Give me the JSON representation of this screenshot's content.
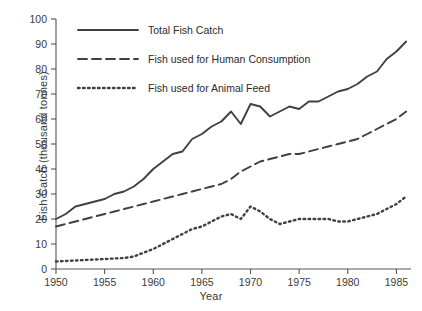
{
  "chart_data": {
    "type": "line",
    "title": "",
    "xlabel": "Year",
    "ylabel": "Fish Catch (thousand tonnes)",
    "xlim": [
      1950,
      1986.5
    ],
    "ylim": [
      0,
      100
    ],
    "xticks": [
      1950,
      1955,
      1960,
      1965,
      1970,
      1975,
      1980,
      1985
    ],
    "xticklabels": [
      "1950",
      "1955",
      "1960",
      "1965",
      "1970",
      "1975",
      "1980",
      "1985"
    ],
    "yticks": [
      0,
      10,
      20,
      30,
      40,
      50,
      60,
      70,
      80,
      90,
      100
    ],
    "yticklabels": [
      "0",
      "10",
      "20",
      "30",
      "40",
      "50",
      "60",
      "70",
      "80",
      "90",
      "100"
    ],
    "grid": false,
    "legend_position": "upper left",
    "x": [
      1950,
      1951,
      1952,
      1953,
      1954,
      1955,
      1956,
      1957,
      1958,
      1959,
      1960,
      1961,
      1962,
      1963,
      1964,
      1965,
      1966,
      1967,
      1968,
      1969,
      1970,
      1971,
      1972,
      1973,
      1974,
      1975,
      1976,
      1977,
      1978,
      1979,
      1980,
      1981,
      1982,
      1983,
      1984,
      1985,
      1986
    ],
    "series": [
      {
        "name": "Total Fish Catch",
        "style": "solid",
        "color": "#404040",
        "values": [
          20,
          22,
          25,
          26,
          27,
          28,
          30,
          31,
          33,
          36,
          40,
          43,
          46,
          47,
          52,
          54,
          57,
          59,
          63,
          58,
          66,
          65,
          61,
          63,
          65,
          64,
          67,
          67,
          69,
          71,
          72,
          74,
          77,
          79,
          84,
          87,
          91
        ]
      },
      {
        "name": "Fish used for Human Consumption",
        "style": "dashed",
        "color": "#404040",
        "values": [
          17,
          18,
          19,
          20,
          21,
          22,
          23,
          24,
          25,
          26,
          27,
          28,
          29,
          30,
          31,
          32,
          33,
          34,
          36,
          39,
          41,
          43,
          44,
          45,
          46,
          46,
          47,
          48,
          49,
          50,
          51,
          52,
          54,
          56,
          58,
          60,
          63
        ]
      },
      {
        "name": "Fish used for Animal Feed",
        "style": "dotted",
        "color": "#404040",
        "values": [
          3,
          3.2,
          3.4,
          3.6,
          3.8,
          4,
          4.2,
          4.4,
          5,
          6.5,
          8,
          10,
          12,
          14,
          16,
          17,
          19,
          21,
          22,
          20,
          25,
          23,
          20,
          18,
          19,
          20,
          20,
          20,
          20,
          19,
          19,
          20,
          21,
          22,
          24,
          26,
          29
        ]
      }
    ],
    "legend": [
      "Total Fish Catch",
      "Fish used for Human Consumption",
      "Fish used for Animal Feed"
    ]
  }
}
